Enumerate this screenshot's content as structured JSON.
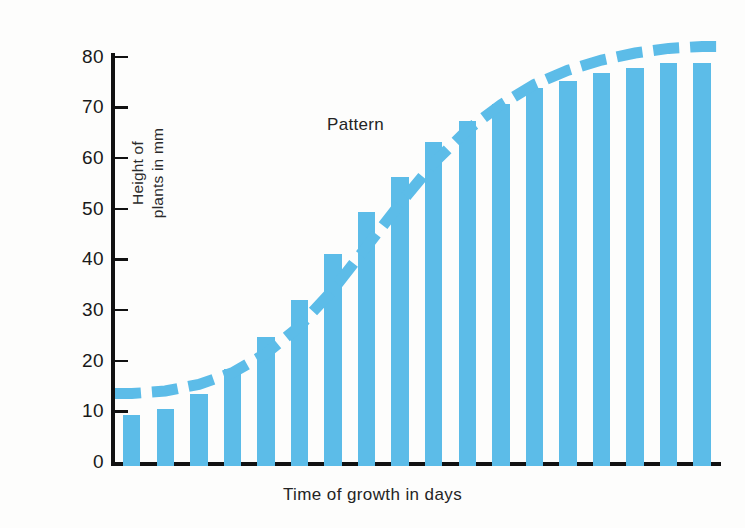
{
  "chart_data": {
    "type": "bar",
    "title": "",
    "subtitle": "",
    "xlabel": "Time of growth in days",
    "ylabel": "Height of plants in mm",
    "ylabel_line1": "Height of",
    "ylabel_line2": "plants in mm",
    "ylim": [
      0,
      80
    ],
    "yticks": [
      0,
      10,
      20,
      30,
      40,
      50,
      60,
      70,
      80
    ],
    "ytick_labels": [
      "0",
      "10",
      "20",
      "30",
      "40",
      "50",
      "60",
      "70",
      "80"
    ],
    "xticks": [],
    "xtick_labels": [],
    "grid": false,
    "legend": false,
    "bar_color": "#5cbce8",
    "axis_color": "#111111",
    "background": "#fdfdfc",
    "categories": [
      "1",
      "2",
      "3",
      "4",
      "5",
      "6",
      "7",
      "8",
      "9",
      "10",
      "11",
      "12",
      "13",
      "14",
      "15",
      "16",
      "17",
      "18"
    ],
    "values": [
      10.0,
      11.3,
      14.3,
      19.2,
      25.4,
      32.7,
      41.8,
      50.2,
      57.0,
      64.0,
      68.0,
      71.5,
      74.5,
      76.0,
      77.5,
      78.5,
      79.5,
      79.5
    ],
    "series": [
      {
        "name": "Height of plants",
        "type": "bar",
        "values": [
          10.0,
          11.3,
          14.3,
          19.2,
          25.4,
          32.7,
          41.8,
          50.2,
          57.0,
          64.0,
          68.0,
          71.5,
          74.5,
          76.0,
          77.5,
          78.5,
          79.5,
          79.5
        ]
      },
      {
        "name": "Pattern",
        "type": "line",
        "style": "dashed",
        "color": "#5cbce8",
        "values": [
          13.5,
          14.0,
          15.3,
          17.6,
          21.4,
          26.8,
          34.0,
          42.5,
          51.0,
          59.0,
          65.5,
          70.5,
          74.5,
          77.3,
          79.3,
          80.7,
          81.6,
          82.0
        ]
      }
    ],
    "annotations": [
      {
        "text": "Pattern",
        "target": "pattern-curve"
      }
    ]
  },
  "annotation": {
    "pattern_label": "Pattern"
  }
}
